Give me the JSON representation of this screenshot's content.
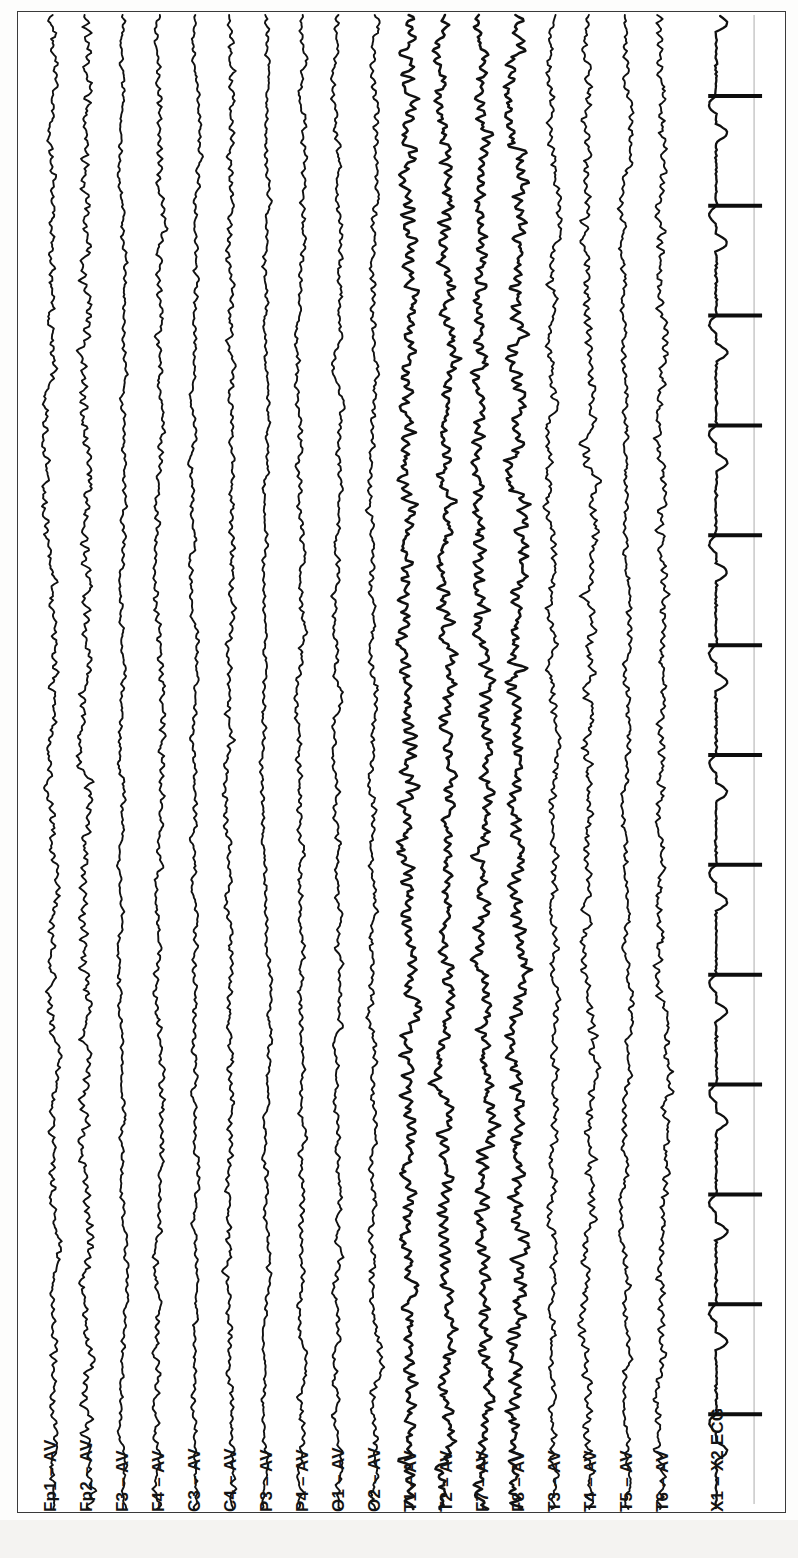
{
  "document": {
    "kind": "eeg-recording-page",
    "orientation": "rotated-90",
    "background_color": "#ffffff",
    "frame_color": "#3a3a3a",
    "trace_color": "#101010",
    "marker_line_color": "#b9b9b9"
  },
  "channels": [
    {
      "label": "Fp1 – AV",
      "name": "Fp1",
      "reference": "AV",
      "type": "eeg",
      "x": 50,
      "amplitude": 9,
      "roughness": 1.0
    },
    {
      "label": "Fp2 – AV",
      "name": "Fp2",
      "reference": "AV",
      "type": "eeg",
      "x": 86,
      "amplitude": 10,
      "roughness": 1.1
    },
    {
      "label": "F3 – AV",
      "name": "F3",
      "reference": "AV",
      "type": "eeg",
      "x": 122,
      "amplitude": 8,
      "roughness": 0.6
    },
    {
      "label": "F4 – AV",
      "name": "F4",
      "reference": "AV",
      "type": "eeg",
      "x": 158,
      "amplitude": 8,
      "roughness": 0.9
    },
    {
      "label": "C3 – AV",
      "name": "C3",
      "reference": "AV",
      "type": "eeg",
      "x": 194,
      "amplitude": 7,
      "roughness": 0.8
    },
    {
      "label": "C4 – AV",
      "name": "C4",
      "reference": "AV",
      "type": "eeg",
      "x": 230,
      "amplitude": 8,
      "roughness": 0.9
    },
    {
      "label": "P3 – AV",
      "name": "P3",
      "reference": "AV",
      "type": "eeg",
      "x": 266,
      "amplitude": 7,
      "roughness": 0.7
    },
    {
      "label": "P4 – AV",
      "name": "P4",
      "reference": "AV",
      "type": "eeg",
      "x": 302,
      "amplitude": 8,
      "roughness": 0.8
    },
    {
      "label": "O1 – AV",
      "name": "O1",
      "reference": "AV",
      "type": "eeg",
      "x": 338,
      "amplitude": 9,
      "roughness": 0.7
    },
    {
      "label": "O2 – AV",
      "name": "O2",
      "reference": "AV",
      "type": "eeg",
      "x": 374,
      "amplitude": 9,
      "roughness": 0.8
    },
    {
      "label": "T1 – AV",
      "name": "T1",
      "reference": "AV",
      "type": "eeg",
      "x": 410,
      "amplitude": 10,
      "roughness": 1.9
    },
    {
      "label": "T2 – AV",
      "name": "T2",
      "reference": "AV",
      "type": "eeg",
      "x": 446,
      "amplitude": 10,
      "roughness": 1.7
    },
    {
      "label": "F7 – AV",
      "name": "F7",
      "reference": "AV",
      "type": "eeg",
      "x": 482,
      "amplitude": 11,
      "roughness": 1.6
    },
    {
      "label": "F8 – AV",
      "name": "F8",
      "reference": "AV",
      "type": "eeg",
      "x": 518,
      "amplitude": 11,
      "roughness": 1.8
    },
    {
      "label": "T3 – AV",
      "name": "T3",
      "reference": "AV",
      "type": "eeg",
      "x": 554,
      "amplitude": 9,
      "roughness": 1.0
    },
    {
      "label": "T4 – AV",
      "name": "T4",
      "reference": "AV",
      "type": "eeg",
      "x": 590,
      "amplitude": 10,
      "roughness": 1.1
    },
    {
      "label": "T5 – AV",
      "name": "T5",
      "reference": "AV",
      "type": "eeg",
      "x": 626,
      "amplitude": 8,
      "roughness": 0.9
    },
    {
      "label": "T6 – AV",
      "name": "T6",
      "reference": "AV",
      "type": "eeg",
      "x": 662,
      "amplitude": 9,
      "roughness": 1.2
    },
    {
      "label": "X1 – X2  ECG",
      "name": "X1-X2",
      "reference": "X2",
      "type": "ecg",
      "x": 717,
      "amplitude": 14,
      "roughness": 0.2
    }
  ],
  "ecg": {
    "beat_period_px": 110,
    "first_beat_y": 95,
    "spike_length_px": 54,
    "spike_thickness_px": 4,
    "beat_count": 14
  },
  "marker_line": {
    "x": 755,
    "y_start": 14,
    "y_end": 1505
  },
  "label_row": {
    "baseline_y": 1497,
    "font_size_px": 17,
    "rotation_deg": -90
  },
  "chart_data": {
    "type": "line",
    "title": "",
    "xlabel": "",
    "ylabel": "",
    "legend_position": "bottom",
    "grid": false,
    "orientation": "vertical-traces-rotated-90",
    "duration_note": "continuous multichannel recording strip",
    "series": [
      {
        "name": "Fp1 – AV",
        "values": []
      },
      {
        "name": "Fp2 – AV",
        "values": []
      },
      {
        "name": "F3 – AV",
        "values": []
      },
      {
        "name": "F4 – AV",
        "values": []
      },
      {
        "name": "C3 – AV",
        "values": []
      },
      {
        "name": "C4 – AV",
        "values": []
      },
      {
        "name": "P3 – AV",
        "values": []
      },
      {
        "name": "P4 – AV",
        "values": []
      },
      {
        "name": "O1 – AV",
        "values": []
      },
      {
        "name": "O2 – AV",
        "values": []
      },
      {
        "name": "T1 – AV",
        "values": []
      },
      {
        "name": "T2 – AV",
        "values": []
      },
      {
        "name": "F7 – AV",
        "values": []
      },
      {
        "name": "F8 – AV",
        "values": []
      },
      {
        "name": "T3 – AV",
        "values": []
      },
      {
        "name": "T4 – AV",
        "values": []
      },
      {
        "name": "T5 – AV",
        "values": []
      },
      {
        "name": "T6 – AV",
        "values": []
      },
      {
        "name": "X1 – X2  ECG",
        "values": []
      }
    ]
  }
}
